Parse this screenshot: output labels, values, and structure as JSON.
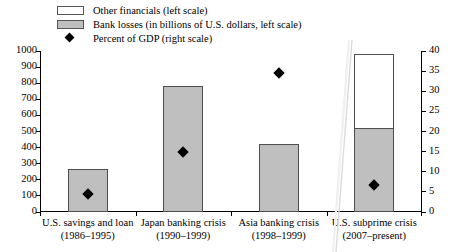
{
  "chart_data": {
    "type": "bar",
    "title": "",
    "subtitle": "",
    "xlabel": "",
    "ylabel_left": "Bank losses (in billions of U.S. dollars, left scale)",
    "ylabel_right": "Percent of GDP (right scale)",
    "ylim_left": [
      0,
      1000
    ],
    "ylim_right": [
      0,
      40
    ],
    "left_ticks": [
      0,
      100,
      200,
      300,
      400,
      500,
      600,
      700,
      800,
      900,
      1000
    ],
    "right_ticks": [
      0,
      5,
      10,
      15,
      20,
      25,
      30,
      35,
      40
    ],
    "grid": false,
    "legend_position": "top-left",
    "stacked": true,
    "categories": [
      {
        "line1": "U.S. savings and loan",
        "line2": "(1986–1995)"
      },
      {
        "line1": "Japan banking crisis",
        "line2": "(1990–1999)"
      },
      {
        "line1": "Asia banking crisis",
        "line2": "(1998–1999)"
      },
      {
        "line1": "U.S. subprime crisis",
        "line2": "(2007–present)"
      }
    ],
    "series": [
      {
        "name": "Bank losses (in billions of U.S. dollars, left scale)",
        "axis": "left",
        "values": [
          270,
          780,
          420,
          520
        ]
      },
      {
        "name": "Other financials (left scale)",
        "axis": "left",
        "values": [
          0,
          0,
          0,
          460
        ]
      },
      {
        "name": "Percent of GDP (right scale)",
        "axis": "right",
        "values": [
          4.5,
          15,
          34.5,
          6.8
        ]
      }
    ]
  },
  "legend": {
    "items": [
      {
        "key": "swatch-white",
        "label": "Other financials (left scale)"
      },
      {
        "key": "swatch-gray",
        "label": "Bank losses (in billions of U.S. dollars, left scale)"
      },
      {
        "key": "marker-diamond",
        "label": "Percent of GDP (right scale)"
      }
    ]
  },
  "axes": {
    "left_ticks": [
      "1000",
      "900",
      "800",
      "700",
      "600",
      "500",
      "400",
      "300",
      "200",
      "100",
      "0"
    ],
    "right_ticks": [
      "40",
      "35",
      "30",
      "25",
      "20",
      "15",
      "10",
      "5",
      "0"
    ]
  },
  "colors": {
    "bank_losses_fill": "#bfbfbf",
    "other_financials_fill": "#ffffff",
    "bar_stroke": "#4d4d4d",
    "marker": "#000000",
    "axis": "#000000",
    "background": "#ffffff"
  }
}
